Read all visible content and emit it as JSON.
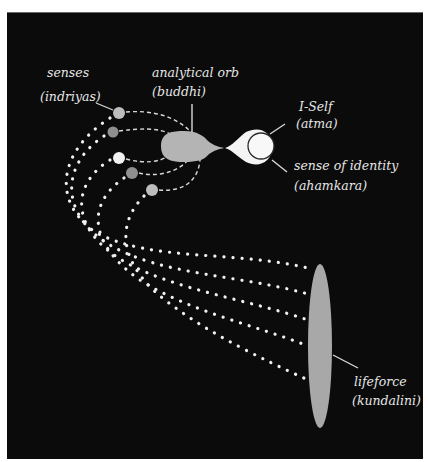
{
  "diagram": {
    "colors": {
      "background": "#0b0b0b",
      "label": "#e6e6e6",
      "orb_light": "#bdbdbd",
      "orb_mid": "#8f8f8f",
      "orb_white": "#f2f2f2",
      "buddhi": "#b4b4b4",
      "atma": "#f4f4f4",
      "kundalini": "#a8a8a8",
      "dots": "#f0f0f0"
    },
    "labels": {
      "senses": {
        "line1": "senses",
        "line2": "(indriyas)"
      },
      "buddhi": {
        "line1": "analytical orb",
        "line2": "(buddhi)"
      },
      "atma": {
        "line1": "I-Self",
        "line2": "(atma)"
      },
      "ahamkara": {
        "line1": "sense of identity",
        "line2": "(ahamkara)"
      },
      "kundalini": {
        "line1": "lifeforce",
        "line2": "(kundalini)"
      }
    },
    "elements": {
      "sense_orbs": [
        {
          "cx": 119,
          "cy": 113,
          "r": 6,
          "shade": "orb_light"
        },
        {
          "cx": 113,
          "cy": 132,
          "r": 5.5,
          "shade": "orb_mid"
        },
        {
          "cx": 119,
          "cy": 158,
          "r": 6,
          "shade": "orb_white"
        },
        {
          "cx": 132,
          "cy": 173,
          "r": 6,
          "shade": "orb_mid"
        },
        {
          "cx": 152,
          "cy": 190,
          "r": 6,
          "shade": "orb_light"
        }
      ],
      "dotted_channels": 5
    }
  }
}
